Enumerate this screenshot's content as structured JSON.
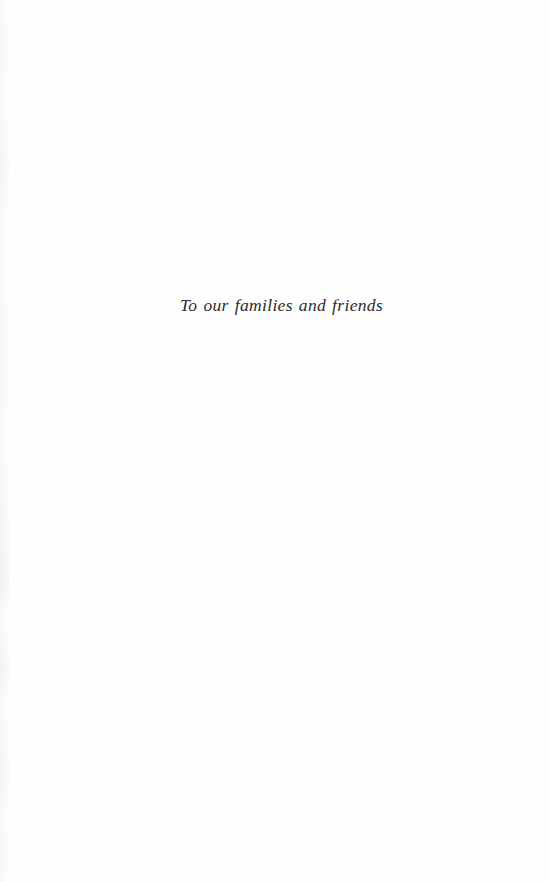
{
  "page": {
    "kind": "book-dedication-page",
    "background_color": "#fefefe",
    "ink_color": "#2b2b2b"
  },
  "dedication": {
    "text": "To our families and friends"
  }
}
